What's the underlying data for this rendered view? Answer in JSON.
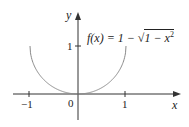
{
  "chart_data": {
    "type": "line",
    "title": "",
    "formula": "f(x) = 1 − √(1 − x²)",
    "xlabel": "x",
    "ylabel": "y",
    "xlim": [
      -1.3,
      1.8
    ],
    "ylim": [
      -0.55,
      1.75
    ],
    "x_ticks": [
      -1,
      1
    ],
    "y_ticks": [
      1
    ],
    "origin_label": "0",
    "grid": false,
    "legend": "none",
    "series": [
      {
        "name": "f(x) = 1 − √(1 − x²)",
        "color": "#8a8a8a",
        "x": [
          -1,
          -0.9,
          -0.8,
          -0.7,
          -0.6,
          -0.5,
          -0.4,
          -0.3,
          -0.2,
          -0.1,
          0,
          0.1,
          0.2,
          0.3,
          0.4,
          0.5,
          0.6,
          0.7,
          0.8,
          0.9,
          1
        ],
        "y": [
          1,
          0.564,
          0.4,
          0.286,
          0.2,
          0.134,
          0.083,
          0.046,
          0.02,
          0.005,
          0,
          0.005,
          0.02,
          0.046,
          0.083,
          0.134,
          0.2,
          0.286,
          0.4,
          0.564,
          1
        ]
      }
    ]
  },
  "labels": {
    "y_axis": "y",
    "x_axis": "x",
    "y_tick_1": "1",
    "x_tick_neg1": "−1",
    "x_tick_1": "1",
    "origin": "0",
    "formula_lhs": "f(x) = 1 − ",
    "formula_sqrt": "1 − x",
    "formula_exp": "2",
    "sqrt_sign": "√"
  },
  "colors": {
    "axis": "#333333",
    "curve": "#8a8a8a",
    "text": "#222222",
    "background": "#ffffff"
  }
}
